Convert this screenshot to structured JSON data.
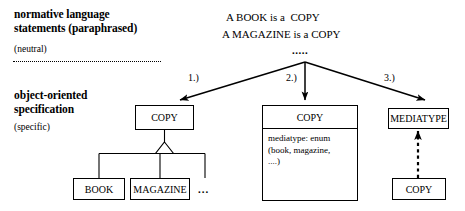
{
  "diagram": {
    "title_domain": "UML modelling alternatives",
    "left_labels": {
      "top_bold_line1": "normative language",
      "top_bold_line2": "statements (paraphrased)",
      "top_small": "(neutral)",
      "bottom_bold_line1": "object-oriented",
      "bottom_bold_line2": "specification",
      "bottom_small": "(specific)"
    },
    "statements": {
      "line1": "A BOOK is a  COPY",
      "line2": "A MAGAZINE is a COPY",
      "continuation": "....."
    },
    "arrow_labels": {
      "one": "1.)",
      "two": "2.)",
      "three": "3.)"
    },
    "option1": {
      "parent_class": "COPY",
      "child_class_1": "BOOK",
      "child_class_2": "MAGAZINE",
      "more_marker": "...",
      "relation": "generalization"
    },
    "option2": {
      "class_name": "COPY",
      "attributes": "mediatype: enum\n(book, magazine,\n....)"
    },
    "option3": {
      "target_class": "MEDIATYPE",
      "source_class": "COPY",
      "relation": "dependency"
    },
    "colors": {
      "stroke": "#000000",
      "fill": "#ffffff",
      "background": "#ffffff"
    }
  }
}
